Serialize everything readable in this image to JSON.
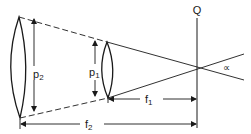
{
  "diagram": {
    "labels": {
      "p2": "p",
      "p2_sub": "2",
      "p1": "p",
      "p1_sub": "1",
      "f1": "f",
      "f1_sub": "1",
      "f2": "f",
      "f2_sub": "2",
      "Q": "Q",
      "alpha": "∝"
    },
    "colors": {
      "stroke": "#1a1a1a",
      "background": "#ffffff"
    }
  }
}
